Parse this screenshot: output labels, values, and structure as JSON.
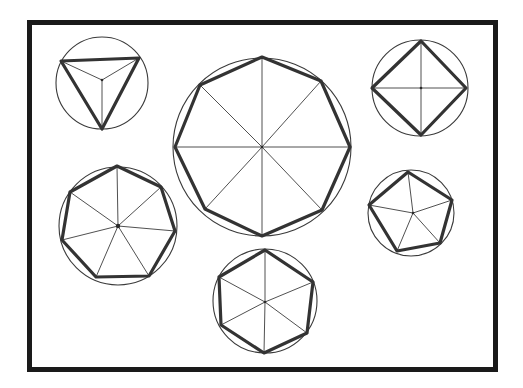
{
  "diagram": {
    "frame": {
      "x": 29.5,
      "y": 22.5,
      "width": 466,
      "height": 347,
      "color": "#1a1a1a"
    },
    "shapes": [
      {
        "name": "triangle",
        "sides": 3,
        "circle": {
          "cx": 102,
          "cy": 83,
          "r": 46
        },
        "center": [
          102,
          80
        ],
        "vertices": [
          [
            61,
            61
          ],
          [
            139,
            58
          ],
          [
            102,
            129
          ]
        ]
      },
      {
        "name": "octagon",
        "sides": 8,
        "circle": {
          "cx": 262,
          "cy": 147,
          "r": 89
        },
        "center": [
          262,
          147
        ],
        "vertices": [
          [
            262,
            57
          ],
          [
            321,
            81
          ],
          [
            350,
            147
          ],
          [
            322,
            210
          ],
          [
            262,
            236
          ],
          [
            205,
            209
          ],
          [
            175,
            147
          ],
          [
            200,
            85
          ]
        ]
      },
      {
        "name": "square",
        "sides": 4,
        "circle": {
          "cx": 420,
          "cy": 88,
          "r": 48
        },
        "center": [
          421,
          88
        ],
        "vertices": [
          [
            421,
            41
          ],
          [
            466,
            88
          ],
          [
            421,
            135
          ],
          [
            372,
            88
          ]
        ]
      },
      {
        "name": "heptagon",
        "sides": 7,
        "circle": {
          "cx": 118,
          "cy": 226,
          "r": 59
        },
        "center": [
          118,
          226
        ],
        "vertices": [
          [
            117,
            166
          ],
          [
            161,
            187
          ],
          [
            175,
            231
          ],
          [
            149,
            276
          ],
          [
            96,
            277
          ],
          [
            62,
            240
          ],
          [
            70,
            192
          ]
        ]
      },
      {
        "name": "pentagon",
        "sides": 5,
        "circle": {
          "cx": 411,
          "cy": 213,
          "r": 43
        },
        "center": [
          413,
          213
        ],
        "vertices": [
          [
            408,
            172
          ],
          [
            452,
            200
          ],
          [
            440,
            243
          ],
          [
            397,
            251
          ],
          [
            369,
            205
          ]
        ]
      },
      {
        "name": "hexagon",
        "sides": 6,
        "circle": {
          "cx": 265,
          "cy": 301,
          "r": 52
        },
        "center": [
          265,
          302
        ],
        "vertices": [
          [
            265,
            250
          ],
          [
            313,
            282
          ],
          [
            307,
            333
          ],
          [
            264,
            353
          ],
          [
            221,
            325
          ],
          [
            219,
            277
          ]
        ]
      }
    ],
    "colors": {
      "frame": "#1a1a1a",
      "polygon": "#333333",
      "circle": "#3a3a3a",
      "spoke": "#3c3c3c",
      "background": "#ffffff"
    }
  }
}
